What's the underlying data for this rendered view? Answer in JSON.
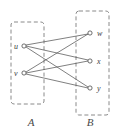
{
  "figure": {
    "type": "bipartite-graph-diagram",
    "background_color": "#ffffff",
    "stroke_color": "#555555",
    "dashed_box_color": "#8a8a8a",
    "label_color": "#3d3d3d"
  },
  "sets": [
    {
      "id": "A",
      "label": "A",
      "label_x": 31,
      "label_y": 126,
      "box": {
        "x": 11,
        "y": 22,
        "width": 33,
        "height": 82
      }
    },
    {
      "id": "B",
      "label": "B",
      "label_x": 90,
      "label_y": 126,
      "box": {
        "x": 76,
        "y": 11,
        "width": 33,
        "height": 104
      }
    }
  ],
  "vertices": [
    {
      "id": "u",
      "label": "u",
      "set": "A",
      "cx": 24,
      "cy": 46,
      "r": 2.1,
      "label_x": 14,
      "label_y": 49
    },
    {
      "id": "v",
      "label": "v",
      "set": "A",
      "cx": 24,
      "cy": 73,
      "r": 2.1,
      "label_x": 14,
      "label_y": 76
    },
    {
      "id": "w",
      "label": "w",
      "set": "B",
      "cx": 90,
      "cy": 33,
      "r": 2.1,
      "label_x": 97,
      "label_y": 36
    },
    {
      "id": "x",
      "label": "x",
      "set": "B",
      "cx": 90,
      "cy": 61,
      "r": 2.1,
      "label_x": 97,
      "label_y": 64
    },
    {
      "id": "y",
      "label": "y",
      "set": "B",
      "cx": 90,
      "cy": 88,
      "r": 2.1,
      "label_x": 97,
      "label_y": 91
    }
  ],
  "edges": [
    {
      "from": "u",
      "to": "w",
      "x1": 26,
      "y1": 45,
      "x2": 88,
      "y2": 34
    },
    {
      "from": "u",
      "to": "x",
      "x1": 26,
      "y1": 46,
      "x2": 88,
      "y2": 60
    },
    {
      "from": "u",
      "to": "y",
      "x1": 26,
      "y1": 47,
      "x2": 88,
      "y2": 87
    },
    {
      "from": "v",
      "to": "w",
      "x1": 26,
      "y1": 72,
      "x2": 88,
      "y2": 34
    },
    {
      "from": "v",
      "to": "x",
      "x1": 26,
      "y1": 73,
      "x2": 88,
      "y2": 61
    },
    {
      "from": "v",
      "to": "y",
      "x1": 26,
      "y1": 74,
      "x2": 88,
      "y2": 88
    }
  ],
  "graph_summary": {
    "edge_count": 6,
    "vertex_count": 5,
    "left_degree": 3,
    "right_degree": 2
  }
}
